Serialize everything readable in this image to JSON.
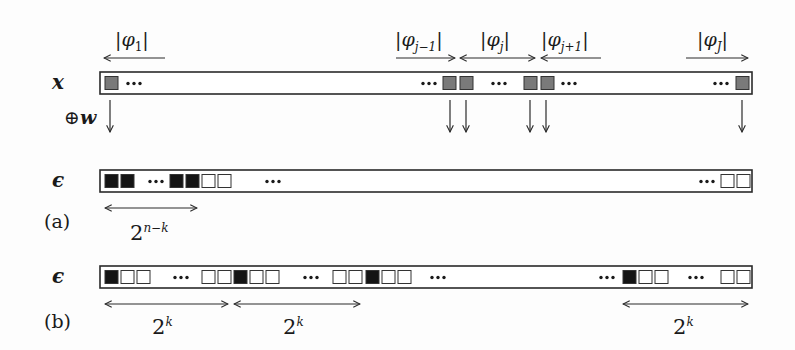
{
  "figure": {
    "rows": [
      {
        "id": "x",
        "label": "x",
        "bar": {
          "x0": 100,
          "x1": 752,
          "y0": 72,
          "y1": 94
        },
        "cells": [
          {
            "x": 105,
            "fill": "gray"
          },
          {
            "x": 443,
            "fill": "gray"
          },
          {
            "x": 460,
            "fill": "gray"
          },
          {
            "x": 524,
            "fill": "gray"
          },
          {
            "x": 541,
            "fill": "gray"
          },
          {
            "x": 736,
            "fill": "gray"
          }
        ],
        "ellipses": [
          128,
          423,
          493,
          563,
          715
        ],
        "down_arrows": [
          110,
          450,
          466,
          530,
          546,
          742
        ],
        "operation_label": "⊕w"
      },
      {
        "id": "eps_a",
        "label": "ϵ",
        "panel": "(a)",
        "bar": {
          "x0": 100,
          "x1": 752,
          "y0": 170,
          "y1": 192
        },
        "cells": [
          {
            "x": 105,
            "fill": "black"
          },
          {
            "x": 121,
            "fill": "black"
          },
          {
            "x": 170,
            "fill": "black"
          },
          {
            "x": 186,
            "fill": "black"
          },
          {
            "x": 202,
            "fill": "white"
          },
          {
            "x": 218,
            "fill": "white"
          },
          {
            "x": 721,
            "fill": "white"
          },
          {
            "x": 737,
            "fill": "white"
          }
        ],
        "ellipses": [
          150,
          267,
          701
        ],
        "spans": [
          {
            "x0": 105,
            "x1": 197,
            "dir": "both",
            "label_base": "2",
            "label_sup": "n−k",
            "label_x": 130
          }
        ]
      },
      {
        "id": "eps_b",
        "label": "ϵ",
        "panel": "(b)",
        "bar": {
          "x0": 100,
          "x1": 752,
          "y0": 266,
          "y1": 288
        },
        "cells": [
          {
            "x": 105,
            "fill": "black"
          },
          {
            "x": 121,
            "fill": "white"
          },
          {
            "x": 137,
            "fill": "white"
          },
          {
            "x": 202,
            "fill": "white"
          },
          {
            "x": 218,
            "fill": "white"
          },
          {
            "x": 234,
            "fill": "black"
          },
          {
            "x": 250,
            "fill": "white"
          },
          {
            "x": 266,
            "fill": "white"
          },
          {
            "x": 333,
            "fill": "white"
          },
          {
            "x": 349,
            "fill": "white"
          },
          {
            "x": 366,
            "fill": "black"
          },
          {
            "x": 382,
            "fill": "white"
          },
          {
            "x": 398,
            "fill": "white"
          },
          {
            "x": 623,
            "fill": "black"
          },
          {
            "x": 639,
            "fill": "white"
          },
          {
            "x": 655,
            "fill": "white"
          },
          {
            "x": 721,
            "fill": "white"
          },
          {
            "x": 737,
            "fill": "white"
          }
        ],
        "ellipses": [
          175,
          305,
          432,
          601,
          690
        ],
        "spans": [
          {
            "x0": 105,
            "x1": 228,
            "dir": "both",
            "label_base": "2",
            "label_sup": "k",
            "label_x": 152
          },
          {
            "x0": 234,
            "x1": 360,
            "dir": "both",
            "label_base": "2",
            "label_sup": "k",
            "label_x": 283
          },
          {
            "x0": 623,
            "x1": 748,
            "dir": "both",
            "label_base": "2",
            "label_sup": "k",
            "label_x": 673
          }
        ]
      }
    ],
    "segments": [
      {
        "name": "phi-1",
        "text": "φ",
        "sub": "1",
        "label_x": 116,
        "x0": 104,
        "x1": 165,
        "dir": "left"
      },
      {
        "name": "phi-j-minus-1",
        "text": "φ",
        "sub": "j−1",
        "label_x": 395,
        "x0": 396,
        "x1": 455,
        "dir": "right"
      },
      {
        "name": "phi-j",
        "text": "φ",
        "sub": "j",
        "label_x": 480,
        "x0": 460,
        "x1": 535,
        "dir": "both"
      },
      {
        "name": "phi-j-plus-1",
        "text": "φ",
        "sub": "j+1",
        "label_x": 542,
        "x0": 541,
        "x1": 601,
        "dir": "left"
      },
      {
        "name": "phi-J",
        "text": "φ",
        "sub": "J",
        "label_x": 698,
        "x0": 686,
        "x1": 748,
        "dir": "right"
      }
    ],
    "colors": {
      "gray_cell": "#7a7a7a",
      "black_cell": "#141414",
      "white_cell": "#ffffff",
      "stroke": "#2a2a2a"
    }
  },
  "labels": {
    "row_x": "x",
    "row_eps_a": "ϵ",
    "row_eps_b": "ϵ",
    "panel_a": "(a)",
    "panel_b": "(b)",
    "oplus": "⊕",
    "w": "w",
    "phi": "φ",
    "bar": "|",
    "sub_1": "1",
    "sub_jm1": "j−1",
    "sub_j": "j",
    "sub_jp1": "j+1",
    "sub_J": "J",
    "two": "2",
    "sup_nk": "n−k",
    "sup_k": "k"
  }
}
